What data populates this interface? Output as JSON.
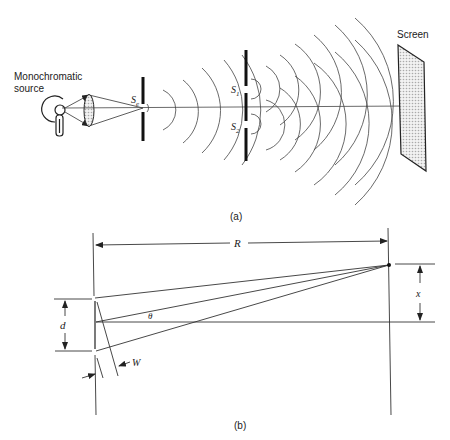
{
  "figure_a": {
    "caption": "(a)",
    "source_label_line1": "Monochromatic",
    "source_label_line2": "source",
    "entrance_slit_label": "S",
    "entrance_slit_sub": "e",
    "slit1_label": "S",
    "slit1_sub": "1",
    "slit2_label": "S",
    "slit2_sub": "2",
    "screen_label": "Screen"
  },
  "figure_b": {
    "caption": "(b)",
    "distance_label": "R",
    "offset_label": "x",
    "slit_separation_label": "d",
    "angle_label": "θ",
    "slit_width_label": "W"
  },
  "colors": {
    "line": "#333333",
    "barrier": "#111111",
    "screen_fill": "#d8d8d8"
  }
}
